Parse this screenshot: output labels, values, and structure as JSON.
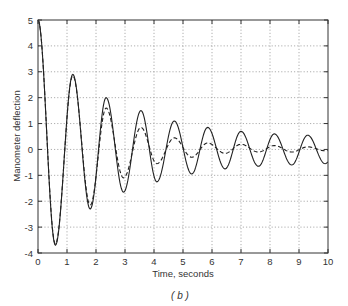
{
  "chart_data": {
    "type": "line",
    "title": "",
    "xlabel": "Time, seconds",
    "ylabel": "Manometer deflection",
    "caption": "(b)",
    "xlim": [
      0,
      10
    ],
    "ylim": [
      -4,
      5
    ],
    "x_ticks": [
      0,
      1,
      2,
      3,
      4,
      5,
      6,
      7,
      8,
      9,
      10
    ],
    "y_ticks": [
      -4,
      -3,
      -2,
      -1,
      0,
      1,
      2,
      3,
      4,
      5
    ],
    "grid": true,
    "legend": null,
    "series": [
      {
        "name": "solid",
        "style": "solid",
        "color": "#222222",
        "x": [
          0,
          0.6,
          1.2,
          1.8,
          2.35,
          2.95,
          3.55,
          4.1,
          4.7,
          5.3,
          5.85,
          6.45,
          7.0,
          7.6,
          8.15,
          8.75,
          9.3,
          9.9
        ],
        "y": [
          5.0,
          -3.7,
          2.9,
          -2.3,
          2.0,
          -1.65,
          1.5,
          -1.25,
          1.1,
          -0.95,
          0.85,
          -0.75,
          0.7,
          -0.65,
          0.6,
          -0.6,
          0.55,
          -0.55
        ]
      },
      {
        "name": "dashed",
        "style": "dashed",
        "color": "#222222",
        "x": [
          0,
          0.6,
          1.2,
          1.8,
          2.35,
          2.95,
          3.55,
          4.1,
          4.7,
          5.3,
          5.85,
          6.45,
          7.0,
          7.6,
          8.15,
          8.75,
          9.3,
          9.9
        ],
        "y": [
          5.0,
          -3.65,
          2.85,
          -2.15,
          1.6,
          -1.1,
          0.85,
          -0.55,
          0.45,
          -0.3,
          0.25,
          -0.15,
          0.2,
          -0.1,
          0.15,
          -0.1,
          0.1,
          -0.05
        ]
      }
    ]
  },
  "labels": {
    "xlabel": "Time, seconds",
    "ylabel": "Manometer deflection",
    "caption": "( b )"
  }
}
